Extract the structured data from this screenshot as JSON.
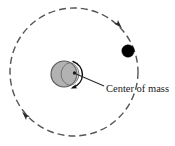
{
  "figure": {
    "width": 175,
    "height": 146,
    "background_color": "#ffffff"
  },
  "labels": {
    "center_of_mass": "Center of mass"
  },
  "colors": {
    "orbit_stroke": "#555555",
    "primary_body_fill": "#b2b2b2",
    "primary_body_highlight": "#d9d9d9",
    "primary_body_stroke": "#5a5a5a",
    "secondary_body_fill": "#000000",
    "leader_line": "#2b2b2b",
    "text": "#1a1a1a",
    "spin_arc": "#111111"
  },
  "geometry": {
    "orbit": {
      "center_x": 74,
      "center_y": 72,
      "radius": 64,
      "dash_pattern": "7 4",
      "stroke_width": 1.4
    },
    "primary_body": {
      "center_x": 64,
      "center_y": 74,
      "radius_x": 13,
      "radius_y": 13
    },
    "secondary_body": {
      "center_x": 128,
      "center_y": 51,
      "radius": 6.2
    },
    "center_of_mass_point": {
      "x": 74,
      "y": 73,
      "radius": 1.6
    },
    "leader_line": {
      "x1": 75,
      "y1": 73,
      "x2": 104,
      "y2": 86
    },
    "label_position": {
      "x": 106,
      "y": 92
    },
    "direction_arrows": [
      {
        "name": "orbit-arrow-upper-right",
        "x": 118,
        "y": 26,
        "angle": 52
      },
      {
        "name": "orbit-arrow-lower-left",
        "x": 24,
        "y": 114,
        "angle": 232
      }
    ],
    "spin_arc": {
      "center_x": 66,
      "center_y": 74,
      "radius_x": 15,
      "radius_y": 14
    }
  },
  "icons": {
    "orbit": "dashed-circle-icon",
    "primary": "grey-sphere-icon",
    "secondary": "black-dot-icon",
    "arrow": "arrowhead-icon"
  }
}
